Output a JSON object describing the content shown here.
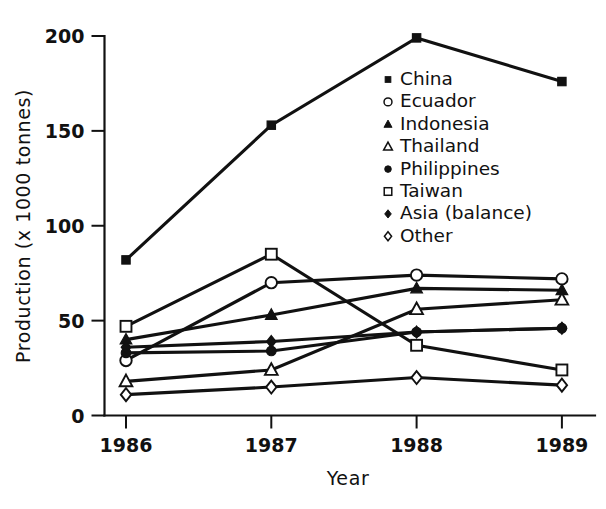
{
  "chart_data": {
    "type": "line",
    "title": "",
    "xlabel": "Year",
    "ylabel": "Production (x 1000 tonnes)",
    "categories": [
      "1986",
      "1987",
      "1988",
      "1989"
    ],
    "x": [
      1986,
      1987,
      1988,
      1989
    ],
    "xlim": [
      1985.72,
      1989.28
    ],
    "ylim": [
      0,
      200
    ],
    "yticks": [
      "0",
      "50",
      "100",
      "150",
      "200"
    ],
    "ytick_values": [
      0,
      50,
      100,
      150,
      200
    ],
    "grid": false,
    "legend_position": "center-right (inside axes)",
    "series": [
      {
        "name": "China",
        "marker": "filled-square",
        "values": [
          82,
          153,
          199,
          176
        ]
      },
      {
        "name": "Ecuador",
        "marker": "open-circle",
        "values": [
          29,
          70,
          74,
          72
        ]
      },
      {
        "name": "Indonesia",
        "marker": "filled-triangle",
        "values": [
          40,
          53,
          67,
          66
        ]
      },
      {
        "name": "Thailand",
        "marker": "open-triangle",
        "values": [
          18,
          24,
          56,
          61
        ]
      },
      {
        "name": "Philippines",
        "marker": "filled-circle",
        "values": [
          33,
          34,
          44,
          46
        ]
      },
      {
        "name": "Taiwan",
        "marker": "open-square",
        "values": [
          47,
          85,
          37,
          24
        ]
      },
      {
        "name": "Asia (balance)",
        "marker": "filled-diamond",
        "values": [
          36,
          39,
          44,
          46
        ]
      },
      {
        "name": "Other",
        "marker": "open-diamond",
        "values": [
          11,
          15,
          20,
          16
        ]
      }
    ]
  },
  "axes": {
    "y_title": "Production (x 1000 tonnes)",
    "x_title": "Year",
    "y_tick_labels": [
      "0",
      "50",
      "100",
      "150",
      "200"
    ],
    "x_tick_labels": [
      "1986",
      "1987",
      "1988",
      "1989"
    ]
  },
  "legend": {
    "entries": [
      {
        "label": "China",
        "marker": "filled-square"
      },
      {
        "label": "Ecuador",
        "marker": "open-circle"
      },
      {
        "label": "Indonesia",
        "marker": "filled-triangle"
      },
      {
        "label": "Thailand",
        "marker": "open-triangle"
      },
      {
        "label": "Philippines",
        "marker": "filled-circle"
      },
      {
        "label": "Taiwan",
        "marker": "open-square"
      },
      {
        "label": "Asia (balance)",
        "marker": "filled-diamond"
      },
      {
        "label": "Other",
        "marker": "open-diamond"
      }
    ]
  },
  "style": {
    "ink": "#111111",
    "paper": "#ffffff"
  }
}
